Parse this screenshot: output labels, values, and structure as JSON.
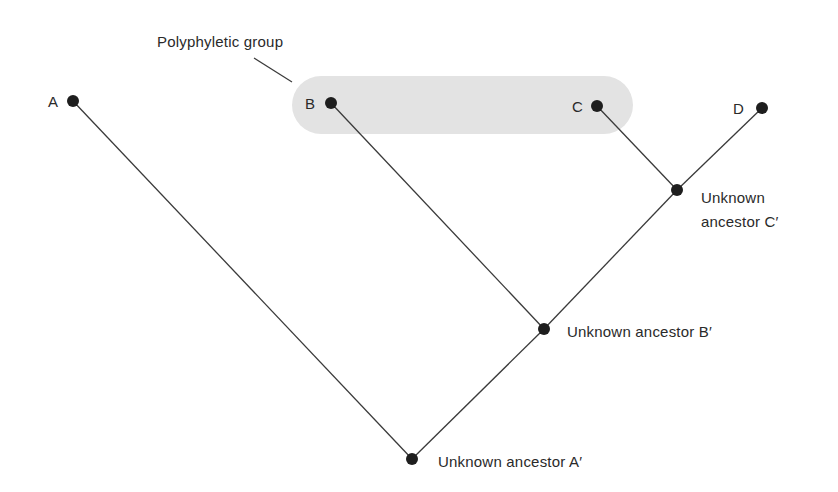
{
  "title_annotation": "Polyphyletic group",
  "colors": {
    "group_fill": "#e3e3e3",
    "line": "#3a3a3a",
    "node": "#1e1e1e"
  },
  "taxa": [
    {
      "id": "A",
      "label": "A",
      "x": 73,
      "y": 101
    },
    {
      "id": "B",
      "label": "B",
      "x": 331,
      "y": 103
    },
    {
      "id": "C",
      "label": "C",
      "x": 597,
      "y": 106
    },
    {
      "id": "D",
      "label": "D",
      "x": 762,
      "y": 108
    }
  ],
  "ancestors": [
    {
      "id": "A'",
      "label": "Unknown ancestor A′",
      "x": 412,
      "y": 459
    },
    {
      "id": "B'",
      "label": "Unknown ancestor B′",
      "x": 544,
      "y": 329
    },
    {
      "id": "C'",
      "line1": "Unknown",
      "line2": "ancestor C′",
      "x": 677,
      "y": 190
    }
  ],
  "edges": [
    [
      "A",
      "A'"
    ],
    [
      "A'",
      "B'"
    ],
    [
      "B",
      "B'"
    ],
    [
      "B'",
      "C'"
    ],
    [
      "C",
      "C'"
    ],
    [
      "C'",
      "D"
    ]
  ]
}
